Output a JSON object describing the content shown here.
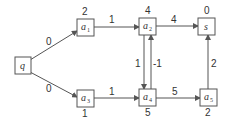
{
  "diagram": {
    "type": "directed-weighted-graph",
    "colors": {
      "stroke": "#555555",
      "text": "#333333",
      "background": "#ffffff"
    },
    "nodes": [
      {
        "id": "q",
        "label": "q",
        "sub": "",
        "value": "",
        "x": 15,
        "y": 57
      },
      {
        "id": "a1",
        "label": "a",
        "sub": "1",
        "value": "2",
        "x": 77,
        "y": 19
      },
      {
        "id": "a2",
        "label": "a",
        "sub": "2",
        "value": "4",
        "x": 139,
        "y": 18
      },
      {
        "id": "s",
        "label": "s",
        "sub": "",
        "value": "0",
        "x": 198,
        "y": 18
      },
      {
        "id": "a3",
        "label": "a",
        "sub": "3",
        "value": "1",
        "x": 77,
        "y": 90
      },
      {
        "id": "a4",
        "label": "a",
        "sub": "4",
        "value": "5",
        "x": 139,
        "y": 89
      },
      {
        "id": "a5",
        "label": "a",
        "sub": "5",
        "value": "2",
        "x": 200,
        "y": 89
      }
    ],
    "edges": [
      {
        "from": "q",
        "to": "a1",
        "weight": "0"
      },
      {
        "from": "q",
        "to": "a3",
        "weight": "0"
      },
      {
        "from": "a1",
        "to": "a2",
        "weight": "1"
      },
      {
        "from": "a2",
        "to": "s",
        "weight": "4"
      },
      {
        "from": "a3",
        "to": "a4",
        "weight": "1"
      },
      {
        "from": "a4",
        "to": "a5",
        "weight": "5"
      },
      {
        "from": "a5",
        "to": "s",
        "weight": "2"
      },
      {
        "from": "a2",
        "to": "a4",
        "weight": "1"
      },
      {
        "from": "a4",
        "to": "a2",
        "weight": "-1"
      }
    ]
  }
}
